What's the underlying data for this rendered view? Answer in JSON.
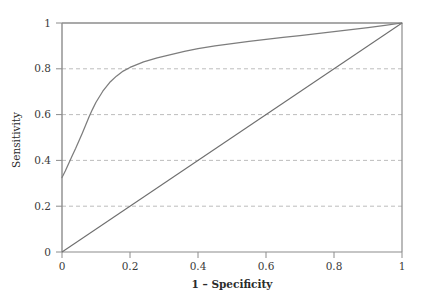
{
  "chart_data": {
    "type": "line",
    "title": "",
    "xlabel": "1 – Specificity",
    "ylabel": "Sensitivity",
    "xlim": [
      0,
      1
    ],
    "ylim": [
      0,
      1
    ],
    "grid": "horizontal-dashed",
    "legend": "none",
    "xticks": [
      "0",
      "0.2",
      "0.4",
      "0.6",
      "0.8",
      "1"
    ],
    "xtick_values": [
      0,
      0.2,
      0.4,
      0.6,
      0.8,
      1
    ],
    "yticks": [
      "0",
      "0.2",
      "0.4",
      "0.6",
      "0.8",
      "1"
    ],
    "ytick_values": [
      0,
      0.2,
      0.4,
      0.6,
      0.8,
      1
    ],
    "gridline_values": [
      0.2,
      0.4,
      0.6,
      0.8
    ],
    "series": [
      {
        "name": "ROC curve",
        "color": "#7d7d7d",
        "style": "solid",
        "x": [
          0,
          0.01,
          0.02,
          0.03,
          0.04,
          0.05,
          0.06,
          0.07,
          0.08,
          0.09,
          0.1,
          0.12,
          0.14,
          0.16,
          0.18,
          0.2,
          0.24,
          0.28,
          0.32,
          0.36,
          0.4,
          0.45,
          0.5,
          0.55,
          0.6,
          0.65,
          0.7,
          0.75,
          0.8,
          0.85,
          0.9,
          0.95,
          1.0
        ],
        "values": [
          0.325,
          0.355,
          0.388,
          0.42,
          0.452,
          0.486,
          0.52,
          0.556,
          0.592,
          0.624,
          0.654,
          0.702,
          0.74,
          0.768,
          0.79,
          0.806,
          0.83,
          0.848,
          0.862,
          0.876,
          0.888,
          0.9,
          0.91,
          0.92,
          0.929,
          0.937,
          0.945,
          0.954,
          0.962,
          0.971,
          0.98,
          0.99,
          1.0
        ]
      },
      {
        "name": "Reference diagonal",
        "color": "#6e6e6e",
        "style": "solid",
        "x": [
          0,
          1
        ],
        "values": [
          0,
          1
        ]
      }
    ]
  },
  "axes": {
    "x_title": "1 – Specificity",
    "y_title": "Sensitivity"
  },
  "caption": {
    "cut_off_text": "                                                                                                            "
  }
}
